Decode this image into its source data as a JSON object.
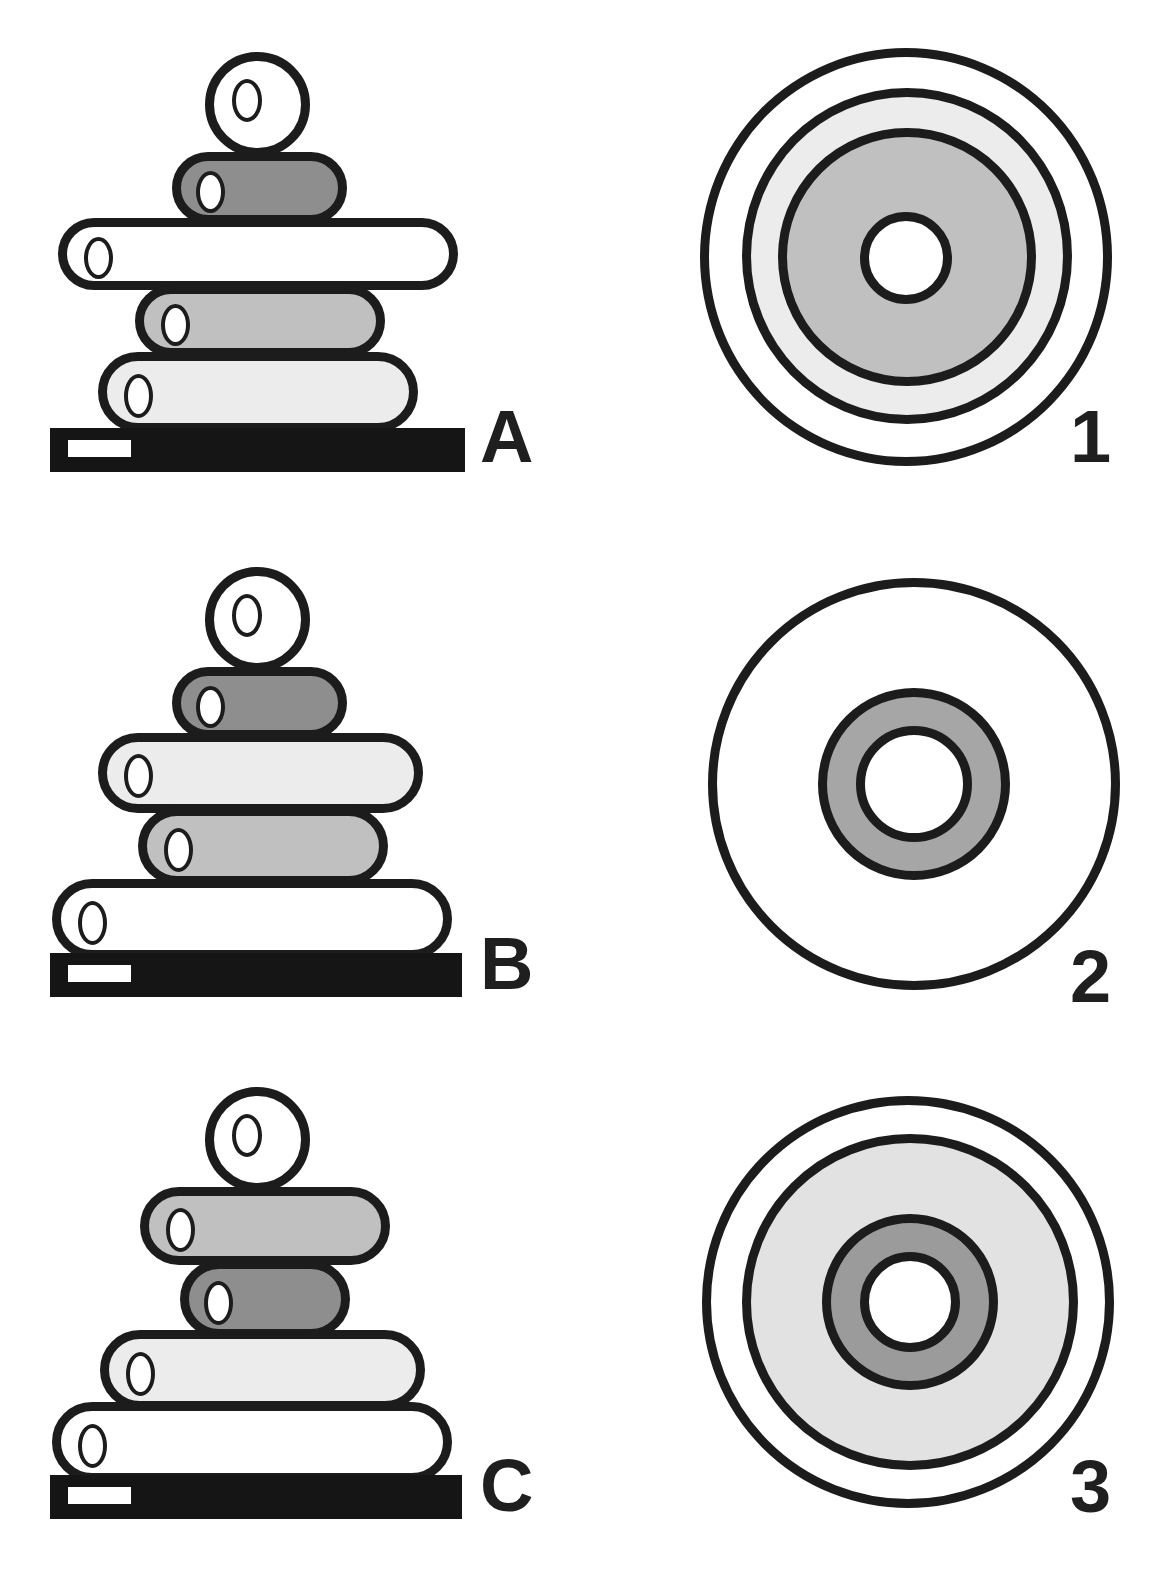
{
  "figure": {
    "title": "",
    "background_color": "#ffffff",
    "outline_color": "#1c1c1c",
    "baseplate_color": "#151515",
    "palette": {
      "white": "#ffffff",
      "very_light_gray": "#ececec",
      "light_gray": "#d9d9d9",
      "medium_gray": "#c0c0c0",
      "dark_gray": "#8e8e8e"
    }
  },
  "panels": [
    {
      "id": "A",
      "label": "A",
      "type": "side-view-stack",
      "scale_bar": {
        "present": true,
        "color": "#ffffff"
      },
      "baseplate": {
        "present": true,
        "color": "#151515"
      },
      "layers": [
        {
          "index": 0,
          "shape": "sphere",
          "fill": "#ffffff",
          "fill_name": "white",
          "position": "top"
        },
        {
          "index": 1,
          "shape": "cylinder",
          "fill": "#8e8e8e",
          "fill_name": "dark-gray",
          "position": "2"
        },
        {
          "index": 2,
          "shape": "cylinder",
          "fill": "#ffffff",
          "fill_name": "white",
          "position": "3"
        },
        {
          "index": 3,
          "shape": "cylinder",
          "fill": "#c0c0c0",
          "fill_name": "medium-gray",
          "position": "4"
        },
        {
          "index": 4,
          "shape": "cylinder",
          "fill": "#ececec",
          "fill_name": "very-light-gray",
          "position": "bottom"
        }
      ]
    },
    {
      "id": "B",
      "label": "B",
      "type": "side-view-stack",
      "scale_bar": {
        "present": true,
        "color": "#ffffff"
      },
      "baseplate": {
        "present": true,
        "color": "#151515"
      },
      "layers": [
        {
          "index": 0,
          "shape": "sphere",
          "fill": "#ffffff",
          "fill_name": "white",
          "position": "top"
        },
        {
          "index": 1,
          "shape": "cylinder",
          "fill": "#8e8e8e",
          "fill_name": "dark-gray",
          "position": "2"
        },
        {
          "index": 2,
          "shape": "cylinder",
          "fill": "#ececec",
          "fill_name": "very-light-gray",
          "position": "3"
        },
        {
          "index": 3,
          "shape": "cylinder",
          "fill": "#c0c0c0",
          "fill_name": "medium-gray",
          "position": "4"
        },
        {
          "index": 4,
          "shape": "cylinder",
          "fill": "#ffffff",
          "fill_name": "white",
          "position": "bottom"
        }
      ]
    },
    {
      "id": "C",
      "label": "C",
      "type": "side-view-stack",
      "scale_bar": {
        "present": true,
        "color": "#ffffff"
      },
      "baseplate": {
        "present": true,
        "color": "#151515"
      },
      "layers": [
        {
          "index": 0,
          "shape": "sphere",
          "fill": "#ffffff",
          "fill_name": "white",
          "position": "top"
        },
        {
          "index": 1,
          "shape": "cylinder",
          "fill": "#c0c0c0",
          "fill_name": "medium-gray",
          "position": "2"
        },
        {
          "index": 2,
          "shape": "cylinder",
          "fill": "#8e8e8e",
          "fill_name": "dark-gray",
          "position": "3"
        },
        {
          "index": 3,
          "shape": "cylinder",
          "fill": "#ececec",
          "fill_name": "very-light-gray",
          "position": "4"
        },
        {
          "index": 4,
          "shape": "cylinder",
          "fill": "#ffffff",
          "fill_name": "white",
          "position": "bottom"
        }
      ]
    },
    {
      "id": "1",
      "label": "1",
      "type": "cross-section-rings",
      "rings": [
        {
          "index": 0,
          "fill": "#ffffff",
          "fill_name": "white",
          "role": "outermost"
        },
        {
          "index": 1,
          "fill": "#ececec",
          "fill_name": "very-light-gray",
          "role": "ring-2"
        },
        {
          "index": 2,
          "fill": "#c0c0c0",
          "fill_name": "medium-gray",
          "role": "ring-3"
        },
        {
          "index": 3,
          "fill": "#ffffff",
          "fill_name": "white",
          "role": "center-hole"
        }
      ]
    },
    {
      "id": "2",
      "label": "2",
      "type": "cross-section-rings",
      "rings": [
        {
          "index": 0,
          "fill": "#ffffff",
          "fill_name": "white",
          "role": "outermost"
        },
        {
          "index": 1,
          "fill": "#a6a6a6",
          "fill_name": "dark-gray",
          "role": "ring-2"
        },
        {
          "index": 2,
          "fill": "#ffffff",
          "fill_name": "white",
          "role": "center-hole"
        }
      ]
    },
    {
      "id": "3",
      "label": "3",
      "type": "cross-section-rings",
      "rings": [
        {
          "index": 0,
          "fill": "#ffffff",
          "fill_name": "white",
          "role": "outermost"
        },
        {
          "index": 1,
          "fill": "#e2e2e2",
          "fill_name": "very-light-gray",
          "role": "ring-2"
        },
        {
          "index": 2,
          "fill": "#9b9b9b",
          "fill_name": "dark-gray",
          "role": "ring-3"
        },
        {
          "index": 3,
          "fill": "#ffffff",
          "fill_name": "white",
          "role": "center-hole"
        }
      ]
    }
  ]
}
